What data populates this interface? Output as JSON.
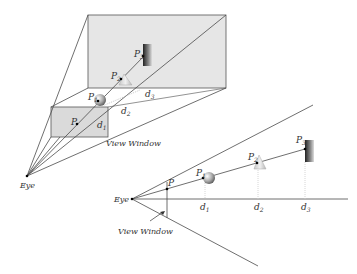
{
  "upper_diagram": {
    "eye_label": "Eye",
    "view_window_label": "View Window",
    "points": {
      "p": "P",
      "p1": "P",
      "p2": "P",
      "p3": "P"
    },
    "point_subscripts": {
      "p1": "1",
      "p2": "2",
      "p3": "3"
    },
    "distances": {
      "d1": "d",
      "d2": "d",
      "d3": "d"
    },
    "distance_subscripts": {
      "d1": "1",
      "d2": "2",
      "d3": "3"
    }
  },
  "lower_diagram": {
    "eye_label": "Eye",
    "view_window_label": "View Window",
    "points": {
      "p": "P",
      "p1": "P",
      "p2": "P",
      "p3": "P"
    },
    "point_subscripts": {
      "p1": "1",
      "p2": "2",
      "p3": "3"
    },
    "distances": {
      "d1": "d",
      "d2": "d",
      "d3": "d"
    },
    "distance_subscripts": {
      "d1": "1",
      "d2": "2",
      "d3": "3"
    }
  },
  "colors": {
    "line": "#4a4a4a",
    "plane_fill": "#e4e4e4",
    "guide": "#cfcfcf"
  }
}
